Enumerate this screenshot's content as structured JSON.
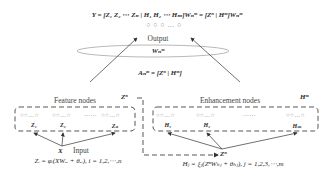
{
  "output_equation": "Y = [Z₁ Z₂ ⋯ Zₙ | H₁ H₂ ⋯ Hₘ]Wₙᵐ = [Zⁿ | Hᵐ]Wₙᵐ",
  "output_nodes": "○ ○ ○ … ○",
  "output_label": "Output",
  "weight_label": "Wₙᵐ",
  "a_equation": "Aₙᵐ = [Zⁿ | Hᵐ]",
  "feature": {
    "title": "Feature nodes",
    "group_label": "Zⁿ",
    "node_glyph": "○○…○",
    "ellipsis": "……",
    "groups": [
      "Z₁",
      "Z₂",
      "Zₙ"
    ]
  },
  "enhancement": {
    "title": "Enhancement nodes",
    "group_label": "Hᵐ",
    "node_glyph": "○○…○",
    "ellipsis": "……",
    "groups": [
      "H₁",
      "H₂",
      "Hₘ"
    ]
  },
  "input": {
    "symbol": "X",
    "label": "Input",
    "feature_equation": "Zᵢ = φᵢ(XWₑᵢ + θₑᵢ), i = 1,2,⋯,n"
  },
  "zn_connector_label": "Zⁿ",
  "enhancement_equation": "Hⱼ = ξⱼ(ZⁿWₕⱼ + θₕⱼ), j = 1,2,3,⋯,m",
  "colors": {
    "line": "#333333",
    "node": "#8a8a8a",
    "ellipse": "#9a9a9a"
  }
}
